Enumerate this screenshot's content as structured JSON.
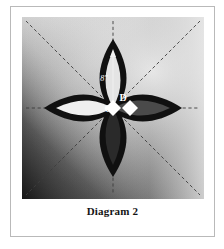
{
  "figure": {
    "caption": "Diagram 2",
    "panel": {
      "background_style": "grayscale radial/diagonal gradient",
      "colors": {
        "petal_fill": "#111111",
        "petal_inner": "#e8e8e8",
        "marker_fill": "#ffffff",
        "axis_line": "#4a4a4a",
        "label_text": "#ffffff",
        "frame_border": "#b9b9b9",
        "caption_text": "#141414",
        "bg_light": "#e6e6e6",
        "bg_mid": "#9a9a9a",
        "bg_dark": "#202020"
      }
    },
    "shape": {
      "name": "four-petal rosette",
      "petal_count": 4,
      "petal_orientations": [
        "up",
        "right",
        "down",
        "left"
      ],
      "description": "Four lens-shaped (vesica) petals radiating from a common center"
    },
    "annotations": {
      "dimension": {
        "text": "8\"",
        "value": 8,
        "unit": "inch",
        "orientation": "vertical",
        "applies_to": "top petal length"
      },
      "vertices": [
        {
          "label": "C",
          "marker": "diamond",
          "position": "left-of-center"
        },
        {
          "label": "D",
          "marker": "diamond",
          "position": "right-of-center"
        }
      ]
    },
    "guide_lines": [
      {
        "name": "horizontal-axis",
        "style": "dashed"
      },
      {
        "name": "vertical-axis",
        "style": "dashed"
      },
      {
        "name": "diagonal-axis-nw-se",
        "style": "dashed"
      },
      {
        "name": "diagonal-axis-ne-sw",
        "style": "dashed"
      }
    ]
  }
}
